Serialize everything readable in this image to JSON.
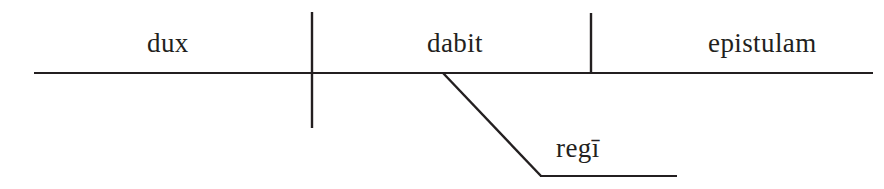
{
  "diagram": {
    "type": "reed-kellogg-sentence-diagram",
    "language": "Latin",
    "sentence": "dux dabit epistulam regī",
    "background_color": "#ffffff",
    "line_color": "#231f20",
    "text_color": "#231f20",
    "labels": {
      "subject": "dux",
      "verb": "dabit",
      "direct_object": "epistulam",
      "indirect_object": "regī"
    },
    "lines": {
      "baseline": {
        "x1": 34,
        "y1": 73,
        "x2": 873,
        "y2": 73
      },
      "subject_verb_divider": {
        "x1": 312,
        "y1": 12,
        "x2": 312,
        "y2": 128
      },
      "verb_object_divider": {
        "x1": 591,
        "y1": 13,
        "x2": 591,
        "y2": 73
      },
      "indirect_object_slant": {
        "x1": 443,
        "y1": 73,
        "x2": 541,
        "y2": 176
      },
      "indirect_object_baseline": {
        "x1": 541,
        "y1": 176,
        "x2": 677,
        "y2": 176
      }
    },
    "stroke_width": 2.2
  }
}
